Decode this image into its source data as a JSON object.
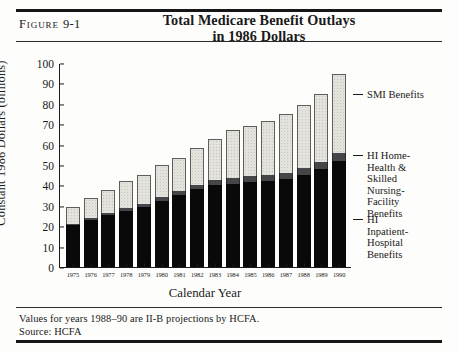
{
  "figure": {
    "label": "Figure",
    "number": "9-1",
    "title_line1": "Total Medicare Benefit Outlays",
    "title_line2": "in 1986 Dollars"
  },
  "notes": {
    "projection_note": "Values for years 1988–90 are II-B projections by HCFA.",
    "source": "Source: HCFA"
  },
  "chart_data": {
    "type": "bar",
    "stacked": true,
    "title": "Total Medicare Benefit Outlays in 1986 Dollars",
    "xlabel": "Calendar Year",
    "ylabel": "Constant 1986 Dollars (billions)",
    "ylim": [
      0,
      100
    ],
    "yticks": [
      0,
      10,
      20,
      30,
      40,
      50,
      60,
      70,
      80,
      90,
      100
    ],
    "grid": false,
    "legend_position": "right",
    "categories": [
      "1975",
      "1976",
      "1977",
      "1978",
      "1979",
      "1980",
      "1981",
      "1982",
      "1983",
      "1984",
      "1985",
      "1986",
      "1987",
      "1988",
      "1989",
      "1990"
    ],
    "series": [
      {
        "name": "HI Inpatient-Hospital Benefits",
        "color": "#090909",
        "values": [
          20.5,
          23.0,
          25.5,
          27.5,
          29.5,
          32.5,
          35.5,
          38.0,
          40.0,
          40.5,
          41.5,
          42.0,
          43.0,
          45.0,
          48.0,
          52.0
        ]
      },
      {
        "name": "HI Home-Health & Skilled Nursing-Facility Benefits",
        "color": "#46464a",
        "values": [
          0.8,
          1.0,
          1.2,
          1.4,
          1.6,
          1.8,
          2.0,
          2.2,
          2.6,
          3.0,
          3.2,
          3.2,
          3.2,
          3.4,
          3.6,
          3.8
        ]
      },
      {
        "name": "SMI Benefits",
        "color": "#e4e2dc",
        "values": [
          8.2,
          10.0,
          11.3,
          13.1,
          13.9,
          15.7,
          16.0,
          18.3,
          20.4,
          23.5,
          24.3,
          26.3,
          28.8,
          31.1,
          33.4,
          38.7
        ]
      }
    ],
    "totals": [
      29.5,
      34.0,
      38.0,
      42.0,
      45.0,
      50.0,
      53.5,
      58.5,
      63.0,
      67.0,
      69.0,
      71.5,
      75.0,
      79.5,
      85.0,
      94.5
    ],
    "legend_labels": [
      "SMI Benefits",
      "HI Home-\nHealth &\nSkilled\nNursing-\nFacility\nBenefits",
      "HI\nInpatient-\nHospital\nBenefits"
    ],
    "legend": {
      "smi": [
        "SMI Benefits"
      ],
      "hhs": [
        "HI Home-",
        "Health &",
        "Skilled",
        "Nursing-",
        "Facility",
        "Benefits"
      ],
      "hi": [
        "HI",
        "Inpatient-",
        "Hospital",
        "Benefits"
      ]
    }
  }
}
